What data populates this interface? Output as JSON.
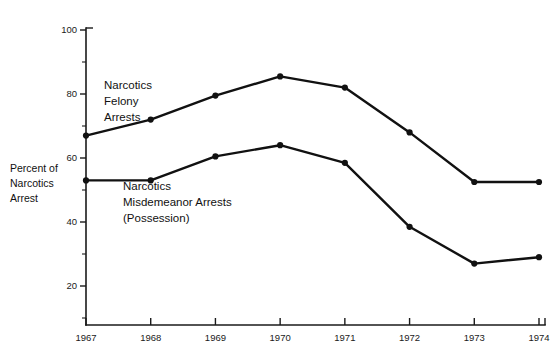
{
  "chart_data": {
    "type": "line",
    "title": "",
    "subtitle": "",
    "xlabel": "",
    "ylabel": "Percent of Narcotics Arrest",
    "ylabel_lines": [
      "Percent of",
      "Narcotics",
      "Arrest"
    ],
    "x": [
      1967,
      1968,
      1969,
      1970,
      1971,
      1972,
      1973,
      1974
    ],
    "categories": [
      "1967",
      "1968",
      "1969",
      "1970",
      "1971",
      "1972",
      "1973",
      "1974"
    ],
    "xtick_labels": [
      "1967",
      "1968",
      "1969",
      "1970",
      "1971",
      "1972",
      "1973",
      "1974"
    ],
    "ytick_labels": [
      "100",
      "80",
      "60",
      "40",
      "20"
    ],
    "yticks": [
      100,
      80,
      60,
      40,
      20
    ],
    "yticks_minor": [
      90,
      70,
      50,
      30,
      10
    ],
    "ylim": [
      0,
      100
    ],
    "xlim": [
      1967,
      1974
    ],
    "grid": false,
    "legend": "inline-annotations",
    "series": [
      {
        "name": "Narcotics Felony Arrests",
        "label_lines": [
          "Narcotics",
          "Felony",
          "Arrests"
        ],
        "color": "#111111",
        "values": [
          67,
          72,
          79.5,
          85.5,
          82,
          68,
          52.5,
          52.5
        ]
      },
      {
        "name": "Narcotics Misdemeanor Arrests (Possession)",
        "label_lines": [
          "Narcotics",
          "Misdemeanor Arrests",
          "(Possession)"
        ],
        "color": "#111111",
        "values": [
          53,
          53,
          60.5,
          64,
          58.5,
          38.5,
          27,
          29
        ]
      }
    ],
    "annotations": [
      {
        "name": "felony-label",
        "lines": [
          "Narcotics",
          "Felony",
          "Arrests"
        ],
        "x_px": 104,
        "y_px": 89
      },
      {
        "name": "misdemeanor-label",
        "lines": [
          "Narcotics",
          "Misdemeanor Arrests",
          "(Possession)"
        ],
        "x_px": 123,
        "y_px": 190
      }
    ]
  },
  "plot_geometry": {
    "left_px": 86,
    "right_px": 539,
    "top_px": 30,
    "bottom_px": 325,
    "y_value_top": 100,
    "y_value_bottom": 0,
    "y_px_top": 30,
    "y_px_bottom": 350
  },
  "axis_title_position": {
    "x_px": 10,
    "y_px": 172
  }
}
